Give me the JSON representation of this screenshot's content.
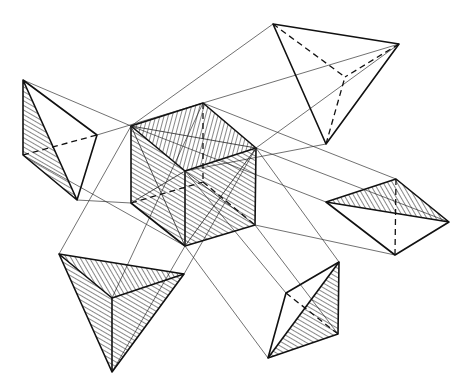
{
  "figure": {
    "title": "",
    "stroke_color": "#111111",
    "background": "#ffffff"
  },
  "shapes": {
    "cube": {
      "name": "central-cube"
    },
    "tetra_left": {
      "name": "left-tetrahedron"
    },
    "tetra_top": {
      "name": "top-tetrahedron"
    },
    "tetra_right": {
      "name": "right-tetrahedron"
    },
    "tetra_bottom_left": {
      "name": "bottom-left-tetrahedron"
    },
    "tetra_bottom_right": {
      "name": "bottom-right-tetrahedron"
    }
  }
}
